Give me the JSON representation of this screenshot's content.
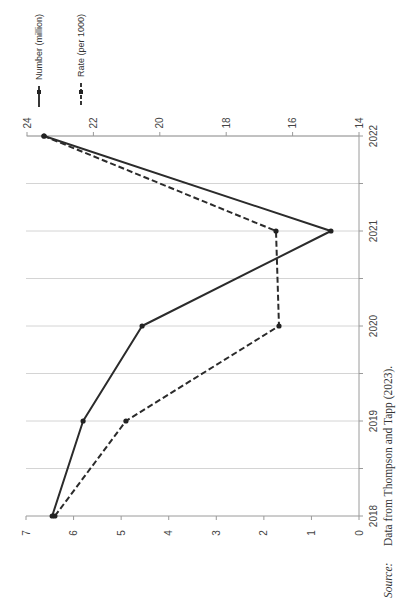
{
  "chart_data": {
    "type": "line",
    "orientation": "rotated-90-clockwise",
    "title": "",
    "x": [
      2018,
      2019,
      2020,
      2021,
      2022
    ],
    "categories": [
      "2018",
      "2019",
      "2020",
      "2021",
      "2022"
    ],
    "series": [
      {
        "name": "Number (million)",
        "axis": "primary",
        "style": "solid",
        "values": [
          6.45,
          5.8,
          4.56,
          0.59,
          6.62
        ]
      },
      {
        "name": "Rate (per 1000)",
        "axis": "secondary",
        "style": "dashed",
        "values": [
          23.16,
          21.02,
          16.41,
          16.5,
          23.49
        ]
      }
    ],
    "primary_axis": {
      "label": "",
      "range": [
        0,
        7
      ],
      "ticks": [
        "0",
        "1",
        "2",
        "3",
        "4",
        "5",
        "6",
        "7"
      ]
    },
    "secondary_axis": {
      "label": "",
      "range": [
        14,
        24
      ],
      "ticks": [
        "14",
        "16",
        "18",
        "20",
        "22",
        "24"
      ]
    },
    "xlabel": "",
    "grid": true,
    "legend_position": "top",
    "source_note": {
      "prefix": "Source:",
      "text": "Data from Thompson and Tapp (2023)."
    }
  },
  "legend": {
    "number_label": "Number (million)",
    "rate_label": "Rate (per 1000)"
  },
  "source": {
    "prefix": "Source:",
    "text": "Data from Thompson and Tapp (2023)."
  }
}
